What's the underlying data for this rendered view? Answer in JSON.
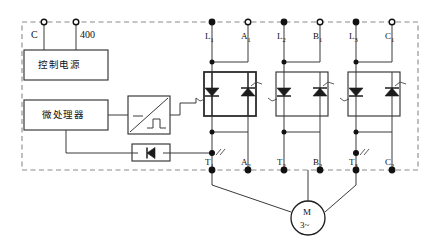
{
  "diagram": {
    "type": "schematic",
    "enclosure": {
      "name": "controller-enclosure",
      "style": "dashed"
    }
  },
  "blocks": {
    "control_power": {
      "label": "控制电源",
      "name": "control-power-supply-block"
    },
    "microprocessor": {
      "label": "微处理器",
      "name": "microprocessor-block"
    },
    "pulse_generator": {
      "label": "",
      "name": "pulse-trigger-block",
      "symbol": "ramp-pulse"
    },
    "optocoupler": {
      "label": "",
      "name": "diode-feedback-block",
      "symbol": "diode"
    }
  },
  "supply_terminals": [
    {
      "id": "C",
      "label": "C",
      "x": 44
    },
    {
      "id": "400",
      "label": "400",
      "x": 76
    }
  ],
  "top_terminals": [
    {
      "id": "L1",
      "label": "L",
      "sub": "1",
      "x": 212
    },
    {
      "id": "A1",
      "label": "A",
      "sub": "1",
      "x": 248
    },
    {
      "id": "L2",
      "label": "L",
      "sub": "2",
      "x": 284
    },
    {
      "id": "B1",
      "label": "B",
      "sub": "1",
      "x": 320
    },
    {
      "id": "L3",
      "label": "L",
      "sub": "3",
      "x": 356
    },
    {
      "id": "C1",
      "label": "C",
      "sub": "1",
      "x": 392
    }
  ],
  "bottom_terminals": [
    {
      "id": "T1",
      "label": "T",
      "sub": "1",
      "x": 212
    },
    {
      "id": "A2",
      "label": "A",
      "sub": "2",
      "x": 248
    },
    {
      "id": "T2",
      "label": "T",
      "sub": "2",
      "x": 284
    },
    {
      "id": "B2",
      "label": "B",
      "sub": "2",
      "x": 320
    },
    {
      "id": "T3",
      "label": "T",
      "sub": "3",
      "x": 356
    },
    {
      "id": "C2",
      "label": "C",
      "sub": "2",
      "x": 392
    }
  ],
  "bypass_marks": [
    {
      "name": "bypass-contact-mark-1",
      "x": 212
    },
    {
      "name": "bypass-contact-mark-3",
      "x": 356
    }
  ],
  "thyristor_groups": [
    {
      "name": "thyristor-group-phase-a",
      "left_x": 212,
      "right_x": 248,
      "highlighted": true
    },
    {
      "name": "thyristor-group-phase-b",
      "left_x": 284,
      "right_x": 320,
      "highlighted": false
    },
    {
      "name": "thyristor-group-phase-c",
      "left_x": 356,
      "right_x": 392,
      "highlighted": false
    }
  ],
  "motor": {
    "name": "three-phase-motor",
    "designator": "M",
    "phases": "3~",
    "cx": 308,
    "cy": 218,
    "r": 17
  },
  "colors": {
    "wire": "#3a3a3a",
    "enclosure": "#8a8a8a",
    "symbol": "#1c1c1c",
    "background": "#ffffff"
  }
}
